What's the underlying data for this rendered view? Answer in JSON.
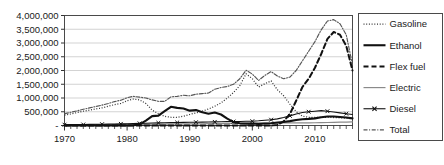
{
  "chart_data": {
    "type": "line",
    "title": "",
    "xlabel": "",
    "ylabel": "",
    "xlim": [
      1970,
      2016
    ],
    "ylim": [
      0,
      4000000
    ],
    "grid": true,
    "legend_position": "right",
    "y_ticks": [
      "-",
      "500,000",
      "1,000,000",
      "1,500,000",
      "2,000,000",
      "2,500,000",
      "3,000,000",
      "3,500,000",
      "4,000,000"
    ],
    "y_tick_values": [
      0,
      500000,
      1000000,
      1500000,
      2000000,
      2500000,
      3000000,
      3500000,
      4000000
    ],
    "x_ticks": [
      "1970",
      "1980",
      "1990",
      "2000",
      "2010"
    ],
    "x_tick_values": [
      1970,
      1980,
      1990,
      2000,
      2010
    ],
    "x": [
      1970,
      1971,
      1972,
      1973,
      1974,
      1975,
      1976,
      1977,
      1978,
      1979,
      1980,
      1981,
      1982,
      1983,
      1984,
      1985,
      1986,
      1987,
      1988,
      1989,
      1990,
      1991,
      1992,
      1993,
      1994,
      1995,
      1996,
      1997,
      1998,
      1999,
      2000,
      2001,
      2002,
      2003,
      2004,
      2005,
      2006,
      2007,
      2008,
      2009,
      2010,
      2011,
      2012,
      2013,
      2014,
      2015,
      2016
    ],
    "series": [
      {
        "name": "Gasoline",
        "style": "dotted",
        "color": "#333333",
        "values": [
          380000,
          420000,
          470000,
          520000,
          560000,
          600000,
          640000,
          700000,
          760000,
          800000,
          900000,
          960000,
          930000,
          800000,
          560000,
          430000,
          330000,
          300000,
          300000,
          340000,
          400000,
          460000,
          520000,
          600000,
          700000,
          820000,
          1000000,
          1200000,
          1450000,
          1880000,
          1700000,
          1400000,
          1520000,
          1620000,
          1300000,
          1080000,
          780000,
          500000,
          340000,
          300000,
          300000,
          300000,
          300000,
          290000,
          280000,
          260000,
          250000
        ]
      },
      {
        "name": "Ethanol",
        "style": "solid-bold",
        "color": "#111111",
        "values": [
          0,
          0,
          0,
          0,
          0,
          0,
          0,
          0,
          0,
          0,
          0,
          10000,
          40000,
          180000,
          340000,
          360000,
          520000,
          680000,
          640000,
          620000,
          540000,
          560000,
          480000,
          430000,
          470000,
          400000,
          250000,
          120000,
          80000,
          70000,
          70000,
          60000,
          70000,
          80000,
          110000,
          130000,
          160000,
          200000,
          230000,
          240000,
          260000,
          300000,
          330000,
          330000,
          310000,
          290000,
          260000
        ]
      },
      {
        "name": "Flex fuel",
        "style": "dashed",
        "color": "#111111",
        "values": [
          0,
          0,
          0,
          0,
          0,
          0,
          0,
          0,
          0,
          0,
          0,
          0,
          0,
          0,
          0,
          0,
          0,
          0,
          0,
          0,
          0,
          0,
          0,
          0,
          0,
          0,
          0,
          0,
          0,
          0,
          0,
          0,
          0,
          0,
          20000,
          150000,
          420000,
          900000,
          1400000,
          1700000,
          2100000,
          2600000,
          3150000,
          3400000,
          3300000,
          2900000,
          2000000
        ]
      },
      {
        "name": "Electric",
        "style": "solid-gray",
        "color": "#8a8a8a",
        "values": [
          20000,
          22000,
          24000,
          26000,
          28000,
          30000,
          32000,
          34000,
          36000,
          38000,
          40000,
          42000,
          44000,
          46000,
          48000,
          50000,
          52000,
          54000,
          56000,
          58000,
          60000,
          62000,
          64000,
          66000,
          68000,
          70000,
          72000,
          74000,
          76000,
          78000,
          80000,
          82000,
          84000,
          86000,
          88000,
          90000,
          92000,
          94000,
          96000,
          98000,
          100000,
          105000,
          110000,
          115000,
          120000,
          125000,
          130000
        ]
      },
      {
        "name": "Diesel",
        "style": "cross-marker",
        "color": "#111111",
        "values": [
          30000,
          32000,
          34000,
          36000,
          40000,
          44000,
          48000,
          52000,
          56000,
          60000,
          66000,
          72000,
          78000,
          84000,
          90000,
          96000,
          100000,
          104000,
          108000,
          112000,
          116000,
          120000,
          124000,
          128000,
          132000,
          136000,
          140000,
          144000,
          148000,
          152000,
          156000,
          170000,
          190000,
          210000,
          240000,
          290000,
          350000,
          420000,
          470000,
          500000,
          520000,
          540000,
          520000,
          490000,
          460000,
          430000,
          400000
        ]
      },
      {
        "name": "Total",
        "style": "dash-dot",
        "color": "#555555",
        "values": [
          430000,
          480000,
          530000,
          590000,
          640000,
          690000,
          740000,
          800000,
          870000,
          920000,
          1010000,
          1060000,
          1030000,
          1000000,
          930000,
          880000,
          880000,
          1040000,
          1060000,
          1100000,
          1080000,
          1140000,
          1160000,
          1180000,
          1320000,
          1380000,
          1420000,
          1500000,
          1700000,
          2010000,
          1870000,
          1640000,
          1820000,
          1960000,
          1800000,
          1700000,
          1760000,
          2000000,
          2350000,
          2700000,
          3050000,
          3480000,
          3800000,
          3850000,
          3700000,
          3300000,
          2200000
        ]
      }
    ],
    "legend": [
      {
        "label": "Gasoline",
        "style": "dotted"
      },
      {
        "label": "Ethanol",
        "style": "solid-bold"
      },
      {
        "label": "Flex fuel",
        "style": "dashed"
      },
      {
        "label": "Electric",
        "style": "solid-gray"
      },
      {
        "label": "Diesel",
        "style": "cross-marker"
      },
      {
        "label": "Total",
        "style": "dash-dot"
      }
    ]
  }
}
